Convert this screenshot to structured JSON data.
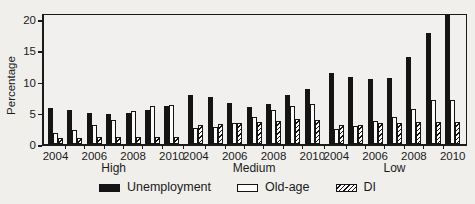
{
  "figure": {
    "background_color": "#f0efec",
    "frame_color": "#1a1a1a",
    "bar_black": "#141414",
    "bar_white": "#fcfcfa"
  },
  "chart_data": {
    "type": "bar",
    "title": "",
    "xlabel": "",
    "ylabel": "Percentage",
    "ylim": [
      0,
      21
    ],
    "yticks": [
      0,
      5,
      10,
      15,
      20
    ],
    "grid": false,
    "legend_position": "bottom-center",
    "group_labels": [
      "High",
      "Medium",
      "Low"
    ],
    "years": [
      "2004",
      "2005",
      "2006",
      "2007",
      "2008",
      "2009",
      "2010"
    ],
    "labeled_years": [
      "2004",
      "2006",
      "2008",
      "2010"
    ],
    "legend": [
      {
        "name": "Unemployment",
        "style": "solid-black"
      },
      {
        "name": "Old-age",
        "style": "white-outline"
      },
      {
        "name": "DI",
        "style": "diagonal-hatch"
      }
    ],
    "series": [
      {
        "name": "Unemployment",
        "groups": {
          "High": [
            5.7,
            5.5,
            5.0,
            4.8,
            5.0,
            5.4,
            6.1
          ],
          "Medium": [
            7.9,
            7.5,
            6.6,
            6.0,
            6.4,
            7.8,
            8.8
          ],
          "Low": [
            11.3,
            10.8,
            10.4,
            10.6,
            14.0,
            17.8,
            20.6
          ]
        }
      },
      {
        "name": "Old-age",
        "groups": {
          "High": [
            1.8,
            2.3,
            3.0,
            3.9,
            5.3,
            6.1,
            6.3
          ],
          "Medium": [
            2.6,
            2.8,
            3.4,
            4.3,
            5.5,
            6.1,
            6.4
          ],
          "Low": [
            2.4,
            2.9,
            3.7,
            4.4,
            5.6,
            7.0,
            7.1
          ]
        }
      },
      {
        "name": "DI",
        "groups": {
          "High": [
            1.0,
            0.9,
            1.1,
            1.2,
            1.2,
            1.2,
            1.2
          ],
          "Medium": [
            3.0,
            3.2,
            3.4,
            3.6,
            3.7,
            4.0,
            3.9
          ],
          "Low": [
            3.0,
            3.0,
            3.3,
            3.3,
            3.6,
            3.6,
            3.6
          ]
        }
      }
    ]
  }
}
